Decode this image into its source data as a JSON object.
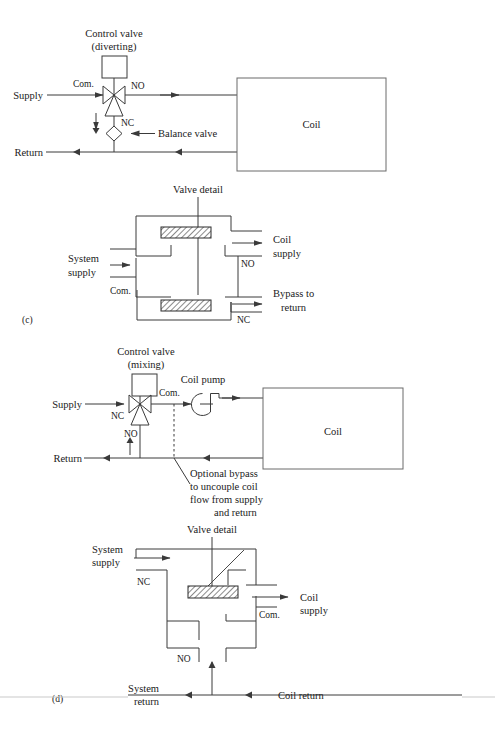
{
  "figure": {
    "panel_c_label": "(c)",
    "panel_d_label": "(d)"
  },
  "panel_c": {
    "schematic": {
      "control_valve_title_line1": "Control valve",
      "control_valve_title_line2": "(diverting)",
      "supply_label": "Supply",
      "return_label": "Return",
      "com_label": "Com.",
      "no_label": "NO",
      "nc_label": "NC",
      "balance_valve_label": "Balance valve",
      "coil_label": "Coil"
    },
    "detail": {
      "title": "Valve detail",
      "system_supply_line1": "System",
      "system_supply_line2": "supply",
      "com_label": "Com.",
      "no_label": "NO",
      "nc_label": "NC",
      "coil_supply_line1": "Coil",
      "coil_supply_line2": "supply",
      "bypass_line1": "Bypass to",
      "bypass_line2": "return"
    }
  },
  "panel_d": {
    "schematic": {
      "control_valve_title_line1": "Control valve",
      "control_valve_title_line2": "(mixing)",
      "supply_label": "Supply",
      "return_label": "Return",
      "com_label": "Com.",
      "no_label": "NO",
      "nc_label": "NC",
      "coil_pump_label": "Coil pump",
      "coil_label": "Coil",
      "optional_bypass_line1": "Optional bypass",
      "optional_bypass_line2": "to uncouple coil",
      "optional_bypass_line3": "flow from supply",
      "optional_bypass_line4": "and return"
    },
    "detail": {
      "title": "Valve detail",
      "system_supply_line1": "System",
      "system_supply_line2": "supply",
      "nc_label": "NC",
      "no_label": "NO",
      "com_label": "Com.",
      "coil_supply_line1": "Coil",
      "coil_supply_line2": "supply",
      "system_return_line1": "System",
      "system_return_line2": "return",
      "coil_return_label": "Coil return"
    }
  },
  "colors": {
    "line": "#3a3a3a",
    "box": "#6a6a6a",
    "text": "#1a1a1a",
    "rule": "#c9c9c9"
  }
}
